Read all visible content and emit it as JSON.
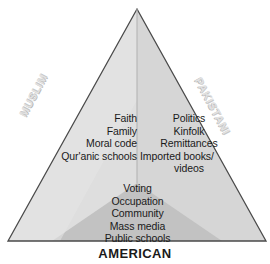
{
  "figure": {
    "type": "triangle-venn-segments",
    "colors": {
      "background": "#ffffff",
      "outline": "#4a4a4a",
      "left_segment": "#dedede",
      "right_segment": "#d6d6d6",
      "bottom_segment": "#c2c2c2",
      "text": "#1a1a1a",
      "side_label": "#e2e2e2"
    },
    "geometry": {
      "apex": [
        137,
        9
      ],
      "base_left": [
        8,
        241
      ],
      "base_right": [
        266,
        241
      ],
      "center_divider_bottom": [
        137,
        183
      ]
    }
  },
  "labels": {
    "left": "MUSLIM",
    "right": "PAKISTANI",
    "bottom": "AMERICAN"
  },
  "segments": {
    "muslim": {
      "label": "MUSLIM",
      "items": [
        "Faith",
        "Family",
        "Moral code",
        "Qur'anic schools"
      ]
    },
    "pakistani": {
      "label": "PAKISTANI",
      "items": [
        "Politics",
        "Kinfolk",
        "Remittances",
        "Imported books/",
        "videos"
      ]
    },
    "american": {
      "label": "AMERICAN",
      "items": [
        "Voting",
        "Occupation",
        "Community",
        "Mass media",
        "Public schools"
      ]
    }
  }
}
